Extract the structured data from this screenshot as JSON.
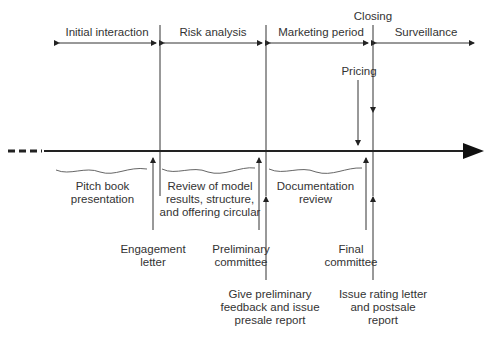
{
  "phases": [
    {
      "label": "Initial interaction",
      "x1": 57,
      "x2": 157
    },
    {
      "label": "Risk analysis",
      "x1": 163,
      "x2": 263
    },
    {
      "label": "Marketing period",
      "x1": 269,
      "x2": 370
    },
    {
      "label": "Surveillance",
      "x1": 376,
      "x2": 476
    }
  ],
  "markers": {
    "closing": "Closing",
    "pricing": "Pricing"
  },
  "activities": [
    {
      "label_lines": [
        "Pitch book",
        "presentation"
      ]
    },
    {
      "label_lines": [
        "Review of model",
        "results, structure,",
        "and offering circular"
      ]
    },
    {
      "label_lines": [
        "Documentation",
        "review"
      ]
    }
  ],
  "events": [
    {
      "label_lines": [
        "Engagement",
        "letter"
      ]
    },
    {
      "label_lines": [
        "Preliminary",
        "committee"
      ]
    },
    {
      "label_lines": [
        "Give preliminary",
        "feedback and issue",
        "presale report"
      ]
    },
    {
      "label_lines": [
        "Final",
        "committee"
      ]
    },
    {
      "label_lines": [
        "Issue rating letter",
        "and postsale",
        "report"
      ]
    }
  ]
}
